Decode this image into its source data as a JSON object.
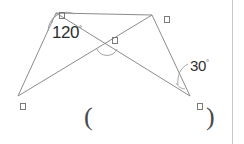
{
  "figure": {
    "stroke_color": "#8c8c8c",
    "label_color": "#6e6e6e",
    "text_color": "#2e2e2e",
    "rule_color": "#c9c9c9",
    "background": "#ffffff",
    "vertices": [
      {
        "name": "vertex-top-left",
        "label": "□",
        "x": 56,
        "y": 13
      },
      {
        "name": "vertex-top-right",
        "label": "□",
        "x": 152,
        "y": 15
      },
      {
        "name": "vertex-bottom-left",
        "label": "□",
        "x": 18,
        "y": 96
      },
      {
        "name": "vertex-bottom-right",
        "label": "□",
        "x": 190,
        "y": 96
      }
    ],
    "intersection": {
      "name": "diagonal-intersection",
      "label": "□",
      "x": 106,
      "y": 43
    },
    "angles": [
      {
        "name": "angle-at-top-left",
        "value": "120",
        "degree": "°",
        "text": "120°"
      },
      {
        "name": "angle-at-bottom-right",
        "value": "30",
        "degree": "°",
        "text": "30°"
      }
    ],
    "edges": [
      "top-left to top-right",
      "top-left to bottom-left",
      "top-right to bottom-right",
      "bottom-left to bottom-right (diagonal)",
      "top-left to bottom-right (diagonal)"
    ]
  },
  "answer": {
    "open_paren": "(",
    "close_paren": ")",
    "value": ""
  }
}
